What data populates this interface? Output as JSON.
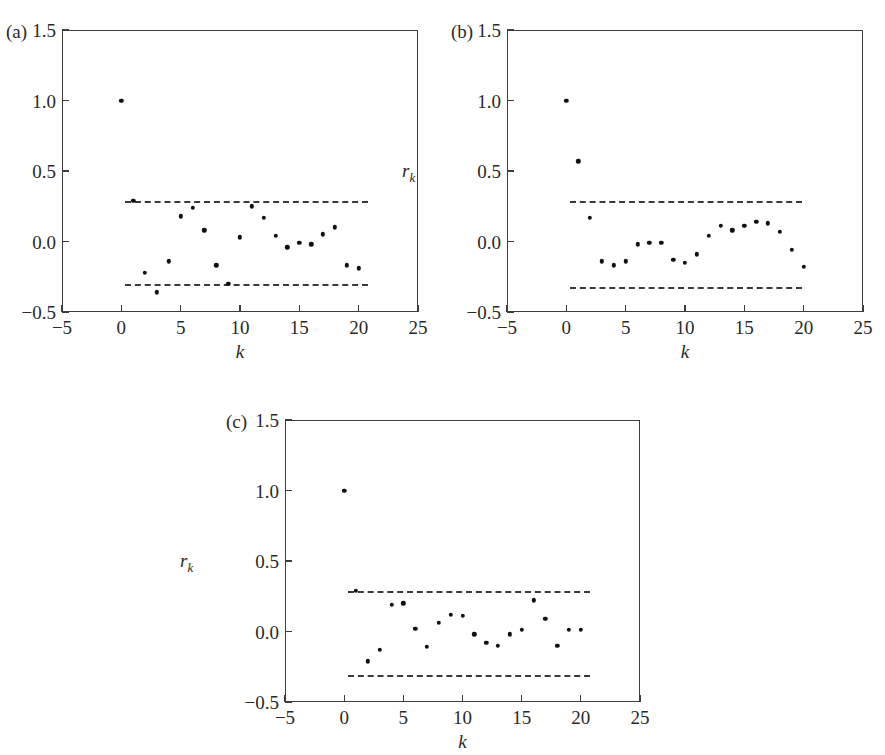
{
  "figure": {
    "background": "#ffffff",
    "series_color": "#111111",
    "axis_color": "#3d3d3d",
    "bound_color": "#3a3a3a"
  },
  "chart_data": [
    {
      "type": "scatter",
      "panel": "(a)",
      "title": "",
      "xlabel": "k",
      "ylabel": "r",
      "ylabel_sub": "k",
      "xlim": [
        -5,
        25
      ],
      "ylim": [
        -0.5,
        1.5
      ],
      "xticks": [
        -5,
        0,
        5,
        10,
        15,
        20,
        25
      ],
      "xticklabels": [
        "−5",
        "0",
        "5",
        "10",
        "15",
        "20",
        "25"
      ],
      "yticks": [
        -0.5,
        0.0,
        0.5,
        1.0,
        1.5
      ],
      "yticklabels": [
        "−0.5",
        "0.0",
        "0.5",
        "1.0",
        "1.5"
      ],
      "grid": false,
      "legend": "none",
      "bounds": {
        "upper": 0.29,
        "lower": -0.3,
        "x_start": 0.3,
        "x_end": 20.8
      },
      "x": [
        0,
        1,
        2,
        3,
        4,
        5,
        6,
        7,
        8,
        9,
        10,
        11,
        12,
        13,
        14,
        15,
        16,
        17,
        18,
        19,
        20
      ],
      "values": [
        1.0,
        0.29,
        -0.22,
        -0.36,
        -0.14,
        0.18,
        0.24,
        0.08,
        -0.17,
        -0.3,
        0.03,
        0.25,
        0.17,
        0.04,
        -0.04,
        -0.01,
        -0.02,
        0.05,
        0.1,
        -0.17,
        -0.19
      ]
    },
    {
      "type": "scatter",
      "panel": "(b)",
      "title": "",
      "xlabel": "k",
      "ylabel": "r",
      "ylabel_sub": "k",
      "xlim": [
        -5,
        25
      ],
      "ylim": [
        -0.5,
        1.5
      ],
      "xticks": [
        -5,
        0,
        5,
        10,
        15,
        20,
        25
      ],
      "xticklabels": [
        "−5",
        "0",
        "5",
        "10",
        "15",
        "20",
        "25"
      ],
      "yticks": [
        -0.5,
        0.0,
        0.5,
        1.0,
        1.5
      ],
      "yticklabels": [
        "−0.5",
        "0.0",
        "0.5",
        "1.0",
        "1.5"
      ],
      "grid": false,
      "legend": "none",
      "bounds": {
        "upper": 0.29,
        "lower": -0.32,
        "x_start": 0.3,
        "x_end": 19.9
      },
      "x": [
        0,
        1,
        2,
        3,
        4,
        5,
        6,
        7,
        8,
        9,
        10,
        11,
        12,
        13,
        14,
        15,
        16,
        17,
        18,
        19,
        20
      ],
      "values": [
        1.0,
        0.57,
        0.17,
        -0.14,
        -0.17,
        -0.14,
        -0.02,
        -0.01,
        -0.01,
        -0.13,
        -0.15,
        -0.09,
        0.04,
        0.11,
        0.08,
        0.11,
        0.14,
        0.13,
        0.07,
        -0.06,
        -0.18
      ]
    },
    {
      "type": "scatter",
      "panel": "(c)",
      "title": "",
      "xlabel": "k",
      "ylabel": "r",
      "ylabel_sub": "k",
      "xlim": [
        -5,
        25
      ],
      "ylim": [
        -0.5,
        1.5
      ],
      "xticks": [
        -5,
        0,
        5,
        10,
        15,
        20,
        25
      ],
      "xticklabels": [
        "−5",
        "0",
        "5",
        "10",
        "15",
        "20",
        "25"
      ],
      "yticks": [
        -0.5,
        0.0,
        0.5,
        1.0,
        1.5
      ],
      "yticklabels": [
        "−0.5",
        "0.0",
        "0.5",
        "1.0",
        "1.5"
      ],
      "grid": false,
      "legend": "none",
      "bounds": {
        "upper": 0.29,
        "lower": -0.31,
        "x_start": 0.3,
        "x_end": 20.8
      },
      "x": [
        0,
        1,
        2,
        3,
        4,
        5,
        6,
        7,
        8,
        9,
        10,
        11,
        12,
        13,
        14,
        15,
        16,
        17,
        18,
        19,
        20
      ],
      "values": [
        1.0,
        0.29,
        -0.21,
        -0.13,
        0.19,
        0.2,
        0.02,
        -0.11,
        0.06,
        0.12,
        0.11,
        -0.02,
        -0.08,
        -0.1,
        -0.02,
        0.01,
        0.22,
        0.09,
        -0.1,
        0.01,
        0.01
      ]
    }
  ],
  "panels": [
    {
      "label": "(a)",
      "frame": {
        "left": 62,
        "top": 30,
        "width": 356,
        "height": 282
      },
      "label_pos": {
        "left": 6,
        "top": 22
      }
    },
    {
      "label": "(b)",
      "frame": {
        "left": 507,
        "top": 30,
        "width": 356,
        "height": 282
      },
      "label_pos": {
        "left": 451,
        "top": 22
      }
    },
    {
      "label": "(c)",
      "frame": {
        "left": 285,
        "top": 420,
        "width": 355,
        "height": 282
      },
      "label_pos": {
        "left": 226,
        "top": 412
      }
    }
  ]
}
